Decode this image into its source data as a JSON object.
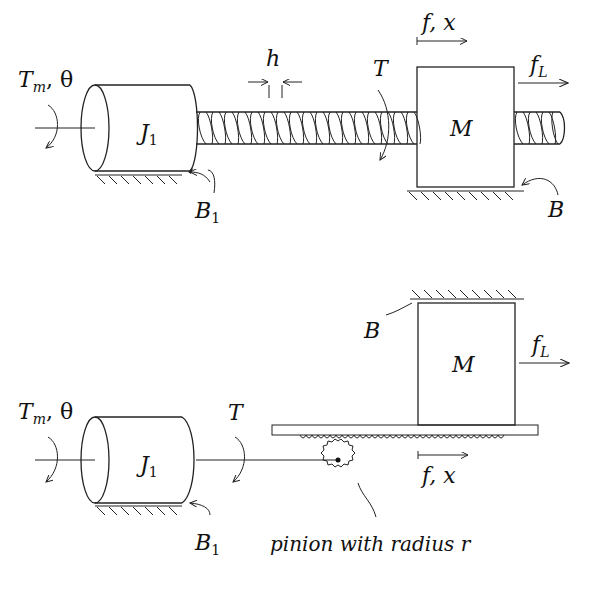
{
  "diagram": {
    "top": {
      "name": "lead-screw-system",
      "labels": {
        "motor_torque": "T",
        "motor_torque_sub": "m",
        "motor_angle": ", θ",
        "inertia": "J",
        "inertia_sub": "1",
        "inertia_damping": "B",
        "inertia_damping_sub": "1",
        "pitch": "h",
        "screw_torque": "T",
        "mass": "M",
        "force_disp": "f, x",
        "load_force": "f",
        "load_force_sub": "L",
        "mass_damping": "B"
      }
    },
    "bottom": {
      "name": "rack-and-pinion-system",
      "labels": {
        "motor_torque": "T",
        "motor_torque_sub": "m",
        "motor_angle": ", θ",
        "inertia": "J",
        "inertia_sub": "1",
        "inertia_damping": "B",
        "inertia_damping_sub": "1",
        "shaft_torque": "T",
        "mass": "M",
        "mass_damping": "B",
        "load_force": "f",
        "load_force_sub": "L",
        "force_disp": "f, x",
        "pinion_caption": "pinion with radius r"
      }
    }
  }
}
